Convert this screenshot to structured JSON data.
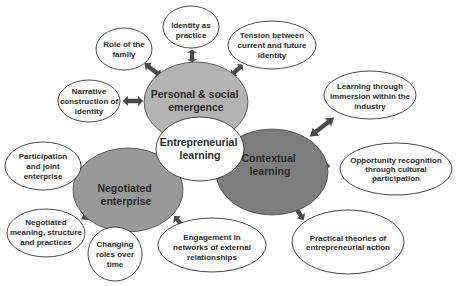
{
  "diagram": {
    "type": "concept-map",
    "colors": {
      "personal": "#b3b3b3",
      "negotiated": "#999999",
      "contextual": "#7d7d7d",
      "center": "#ffffff",
      "arrow": "#4a4a4a",
      "outline": "#333333"
    },
    "center": {
      "lines": [
        "Entrepreneurial",
        "learning"
      ]
    },
    "themes": [
      {
        "id": "personal",
        "lines": [
          "Personal & social",
          "emergence"
        ]
      },
      {
        "id": "negotiated",
        "lines": [
          "Negotiated",
          "enterprise"
        ]
      },
      {
        "id": "contextual",
        "lines": [
          "Contextual",
          "learning"
        ]
      }
    ],
    "satellites": {
      "role_family": {
        "theme": "personal",
        "lines": [
          "Role of the",
          "family"
        ]
      },
      "identity_practice": {
        "theme": "personal",
        "lines": [
          "Identity as",
          "practice"
        ]
      },
      "tension": {
        "theme": "personal",
        "lines": [
          "Tension between",
          "current and future",
          "identity"
        ]
      },
      "narrative": {
        "theme": "personal",
        "lines": [
          "Narrative",
          "construction of",
          "identity"
        ]
      },
      "immersion": {
        "theme": "contextual",
        "lines": [
          "Learning through",
          "immersion within the",
          "industry"
        ]
      },
      "opportunity": {
        "theme": "contextual",
        "lines": [
          "Opportunity recognition",
          "through cultural",
          "participation"
        ]
      },
      "practical": {
        "theme": "contextual",
        "lines": [
          "Practical theories of",
          "entrepreneurial action"
        ]
      },
      "participation": {
        "theme": "negotiated",
        "lines": [
          "Participation",
          "and joint",
          "enterprise"
        ]
      },
      "negotiated_meaning": {
        "theme": "negotiated",
        "lines": [
          "Negotiated",
          "meaning, structure",
          "and practices"
        ]
      },
      "changing_roles": {
        "theme": "negotiated",
        "lines": [
          "Changing",
          "roles over",
          "time"
        ]
      },
      "engagement": {
        "theme": "negotiated",
        "lines": [
          "Engagement in",
          "networks of external",
          "relationships"
        ]
      }
    }
  }
}
